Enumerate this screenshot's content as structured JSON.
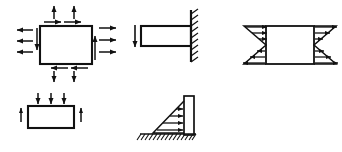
{
  "figure": {
    "width": 342,
    "height": 152,
    "background_color": "#ffffff",
    "line_color": "#111111",
    "fill_color": "#ffffff",
    "diagrams": [
      {
        "id": "stress-element",
        "name": "stress-element-diagram",
        "label": "Plane stress element with normal and shear stresses",
        "position": {
          "x": 16,
          "y": 4,
          "width": 104,
          "height": 78
        },
        "body": {
          "shape": "rectangle",
          "x": 40,
          "y": 26,
          "width": 52,
          "height": 38
        },
        "arrow_groups": [
          {
            "name": "top-normal-arrows",
            "direction": "up",
            "count": 2,
            "edge": "top",
            "meaning": "tensile normal stress"
          },
          {
            "name": "top-shear-arrows",
            "direction": "right",
            "count": 2,
            "edge": "top",
            "meaning": "shear stress"
          },
          {
            "name": "left-normal-arrows",
            "direction": "left",
            "count": 3,
            "edge": "left",
            "meaning": "tensile normal stress"
          },
          {
            "name": "left-shear-arrow",
            "direction": "down",
            "count": 1,
            "edge": "left",
            "meaning": "shear stress"
          },
          {
            "name": "right-normal-arrows",
            "direction": "right",
            "count": 3,
            "edge": "right",
            "meaning": "tensile normal stress"
          },
          {
            "name": "right-shear-arrow",
            "direction": "up",
            "count": 1,
            "edge": "right",
            "meaning": "shear stress"
          },
          {
            "name": "bottom-normal-arrows",
            "direction": "down",
            "count": 2,
            "edge": "bottom",
            "meaning": "tensile normal stress"
          },
          {
            "name": "bottom-shear-arrows",
            "direction": "left",
            "count": 2,
            "edge": "bottom",
            "meaning": "shear stress"
          }
        ]
      },
      {
        "id": "loaded-block",
        "name": "loaded-block-diagram",
        "label": "Block with three downward loads and two upward end reactions",
        "position": {
          "x": 18,
          "y": 92,
          "width": 96,
          "height": 48
        },
        "body": {
          "shape": "rectangle",
          "x": 28,
          "y": 106,
          "width": 46,
          "height": 22
        },
        "arrow_groups": [
          {
            "name": "top-load-arrows",
            "direction": "down",
            "count": 3,
            "edge": "top",
            "meaning": "applied distributed load"
          },
          {
            "name": "left-reaction-arrow",
            "direction": "up",
            "count": 1,
            "edge": "left",
            "meaning": "support reaction"
          },
          {
            "name": "right-reaction-arrow",
            "direction": "up",
            "count": 1,
            "edge": "right",
            "meaning": "support reaction"
          }
        ]
      },
      {
        "id": "cantilever-beam",
        "name": "cantilever-beam-diagram",
        "label": "Cantilever beam fixed at right wall with downward tip load",
        "position": {
          "x": 128,
          "y": 8,
          "width": 78,
          "height": 66
        },
        "body": {
          "shape": "rectangle",
          "x": 141,
          "y": 26,
          "width": 50,
          "height": 20
        },
        "support": {
          "type": "fixed-wall",
          "side": "right",
          "hatch_count": 9
        },
        "arrow_groups": [
          {
            "name": "tip-load-arrow",
            "direction": "down",
            "count": 1,
            "edge": "left",
            "meaning": "concentrated tip load"
          }
        ]
      },
      {
        "id": "retaining-wall",
        "name": "retaining-wall-diagram",
        "label": "Retaining wall on hatched ground with triangular lateral earth pressure",
        "position": {
          "x": 138,
          "y": 90,
          "width": 76,
          "height": 56
        },
        "body": {
          "shape": "rectangle",
          "x": 184,
          "y": 96,
          "width": 10,
          "height": 39
        },
        "support": {
          "type": "ground-hatch",
          "side": "bottom",
          "hatch_count": 13
        },
        "pressure": {
          "shape": "triangle",
          "apex": "top-left",
          "base": "bottom",
          "arrow_count": 4,
          "direction": "right",
          "meaning": "linearly increasing lateral pressure"
        }
      },
      {
        "id": "shear-distribution-block",
        "name": "shear-distribution-diagram",
        "label": "Block with linearly varying (bowtie) shear distributions on both vertical faces",
        "position": {
          "x": 240,
          "y": 18,
          "width": 98,
          "height": 56
        },
        "body": {
          "shape": "rectangle",
          "x": 266,
          "y": 26,
          "width": 48,
          "height": 38
        },
        "arrow_groups": [
          {
            "name": "left-upper-arrows",
            "direction": "right",
            "count": 3,
            "edge": "left",
            "meaning": "shear decreasing toward mid-height"
          },
          {
            "name": "left-lower-arrows",
            "direction": "left",
            "count": 3,
            "edge": "left",
            "meaning": "reversed shear below mid-height"
          },
          {
            "name": "right-upper-arrows",
            "direction": "right",
            "count": 3,
            "edge": "right",
            "meaning": "shear decreasing toward mid-height"
          },
          {
            "name": "right-lower-arrows",
            "direction": "left",
            "count": 3,
            "edge": "right",
            "meaning": "reversed shear below mid-height"
          }
        ]
      }
    ]
  }
}
